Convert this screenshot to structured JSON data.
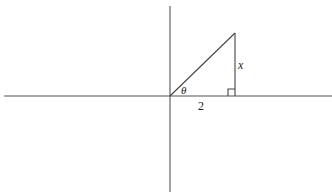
{
  "diagram": {
    "type": "right-triangle-on-axes",
    "labels": {
      "angle": "θ",
      "adjacent": "2",
      "opposite": "x"
    },
    "geometry": {
      "origin": [
        170,
        96
      ],
      "apex": [
        235,
        33
      ],
      "foot": [
        235,
        96
      ],
      "right_angle_marker": true
    },
    "colors": {
      "line": "#444444",
      "axis": "#555555",
      "background": "#ffffff"
    }
  }
}
